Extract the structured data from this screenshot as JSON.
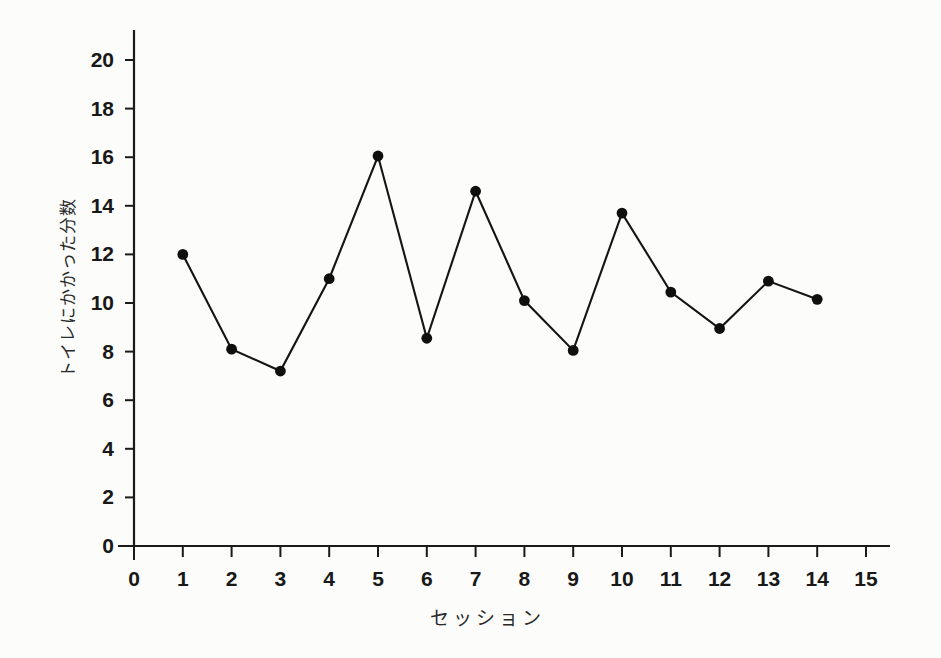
{
  "chart_data": {
    "type": "line",
    "title": "",
    "xlabel": "セッション",
    "ylabel": "トイレにかかった分数",
    "x": [
      1,
      2,
      3,
      4,
      5,
      6,
      7,
      8,
      9,
      10,
      11,
      12,
      13,
      14
    ],
    "values": [
      12.0,
      8.1,
      7.2,
      11.0,
      16.05,
      8.55,
      14.6,
      10.1,
      8.05,
      13.7,
      10.45,
      8.95,
      10.9,
      10.15
    ],
    "series": [
      {
        "name": "トイレにかかった分数",
        "values": [
          12.0,
          8.1,
          7.2,
          11.0,
          16.05,
          8.55,
          14.6,
          10.1,
          8.05,
          13.7,
          10.45,
          8.95,
          10.9,
          10.15
        ]
      }
    ],
    "xlim": [
      0,
      15
    ],
    "ylim": [
      0,
      20
    ],
    "x_ticks": [
      0,
      1,
      2,
      3,
      4,
      5,
      6,
      7,
      8,
      9,
      10,
      11,
      12,
      13,
      14,
      15
    ],
    "x_tick_labels": [
      "0",
      "1",
      "2",
      "3",
      "4",
      "5",
      "6",
      "7",
      "8",
      "9",
      "10",
      "11",
      "12",
      "13",
      "14",
      "15"
    ],
    "y_ticks": [
      0,
      2,
      4,
      6,
      8,
      10,
      12,
      14,
      16,
      18,
      20
    ],
    "y_tick_labels": [
      "0",
      "2",
      "4",
      "6",
      "8",
      "10",
      "12",
      "14",
      "16",
      "18",
      "20"
    ],
    "grid": false,
    "legend": false,
    "marker": "filled-circle",
    "line_color": "#141414",
    "marker_color": "#0f0f0f",
    "background_color": "#fcfcfa"
  }
}
